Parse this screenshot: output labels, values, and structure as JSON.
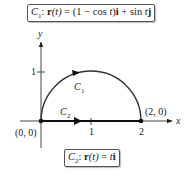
{
  "curve1_box": {
    "name": "C",
    "subscript": "1",
    "equation_prefix": ": ",
    "r": "r",
    "t_arg": "(t)",
    "rhs_1": " = (1 − cos ",
    "t1": "t",
    "rhs_2": ")",
    "i": "i",
    "rhs_3": " + sin ",
    "t2": "t",
    "j": "j"
  },
  "curve2_box": {
    "name": "C",
    "subscript": "2",
    "equation_prefix": ": ",
    "r": "r",
    "t_arg": "(t)",
    "rhs_1": " = ",
    "t1": "t",
    "i": "i"
  },
  "axes": {
    "x_label": "x",
    "y_label": "y",
    "x_tick_1": "1",
    "x_tick_2": "2",
    "y_tick_1": "1"
  },
  "points": {
    "origin": "(0, 0)",
    "end": "(2, 0)"
  },
  "curve_labels": {
    "c1_name": "C",
    "c1_sub": "1",
    "c2_name": "C",
    "c2_sub": "2"
  },
  "colors": {
    "curve": "#222222",
    "axis": "#333333"
  }
}
